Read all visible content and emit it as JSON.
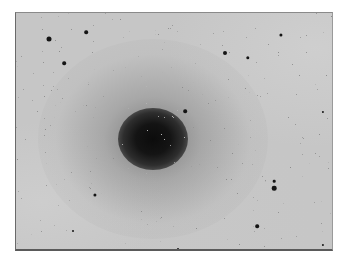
{
  "image": {
    "description": "Negative photographic plate of an elliptical galaxy with surrounding field stars",
    "background_color": "#c6c6c6",
    "core_color": "#0c0c0c",
    "star_color": "#141414",
    "plate_bounds": {
      "left": 15,
      "top": 12,
      "right": 333,
      "bottom": 251
    }
  },
  "galaxy": {
    "center": {
      "x": 152,
      "y": 138
    },
    "core_size": {
      "w": 70,
      "h": 62
    },
    "halo_size": {
      "w": 230,
      "h": 200
    }
  },
  "stars": [
    {
      "x": 48,
      "y": 38,
      "r": 2.5
    },
    {
      "x": 85,
      "y": 31,
      "r": 1.8
    },
    {
      "x": 63,
      "y": 62,
      "r": 1.8
    },
    {
      "x": 224,
      "y": 52,
      "r": 2.0
    },
    {
      "x": 247,
      "y": 57,
      "r": 1.7
    },
    {
      "x": 280,
      "y": 34,
      "r": 1.6
    },
    {
      "x": 184,
      "y": 110,
      "r": 1.8
    },
    {
      "x": 94,
      "y": 194,
      "r": 1.6
    },
    {
      "x": 273,
      "y": 180,
      "r": 1.3
    },
    {
      "x": 273,
      "y": 187,
      "r": 2.3
    },
    {
      "x": 256,
      "y": 225,
      "r": 1.8
    },
    {
      "x": 322,
      "y": 244,
      "r": 1.1
    },
    {
      "x": 322,
      "y": 111,
      "r": 1.1
    },
    {
      "x": 72,
      "y": 230,
      "r": 1.0
    },
    {
      "x": 177,
      "y": 248,
      "r": 1.0
    }
  ]
}
